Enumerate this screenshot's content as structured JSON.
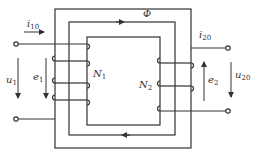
{
  "diagram": {
    "stroke_color": "#333333",
    "labels": {
      "flux": "Φ",
      "primary_current": {
        "base": "i",
        "sub": "10"
      },
      "secondary_current": {
        "base": "i",
        "sub": "20"
      },
      "primary_voltage": {
        "base": "u",
        "sub": "1"
      },
      "primary_emf": {
        "base": "e",
        "sub": "1"
      },
      "primary_turns": {
        "base": "N",
        "sub": "1"
      },
      "secondary_turns": {
        "base": "N",
        "sub": "2"
      },
      "secondary_emf": {
        "base": "e",
        "sub": "2"
      },
      "secondary_voltage": {
        "base": "u",
        "sub": "20"
      }
    }
  }
}
